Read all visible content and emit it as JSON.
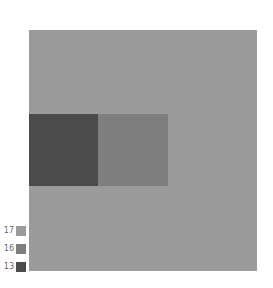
{
  "chart_data": {
    "type": "heatmap",
    "title": "",
    "xlabel": "",
    "ylabel": "",
    "grid": false,
    "legend_position": "bottom-left",
    "legend": [
      {
        "label": "17",
        "color": "#9b9b9b"
      },
      {
        "label": "16",
        "color": "#7e7e7e"
      },
      {
        "label": "13",
        "color": "#4b4b4b"
      }
    ],
    "regions": [
      {
        "name": "background",
        "value": 17,
        "color": "#9b9b9b",
        "x": 0,
        "y": 0,
        "w": 228,
        "h": 241
      },
      {
        "name": "dark-block",
        "value": 13,
        "color": "#4b4b4b",
        "x": 0,
        "y": 84,
        "w": 69,
        "h": 72
      },
      {
        "name": "medium-block",
        "value": 16,
        "color": "#7e7e7e",
        "x": 69,
        "y": 84,
        "w": 70,
        "h": 72
      }
    ]
  }
}
